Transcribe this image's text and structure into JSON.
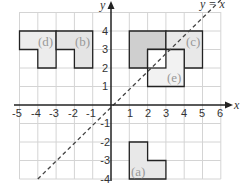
{
  "diagram": {
    "x_axis": {
      "label": "x",
      "ticks": [
        "-5",
        "-4",
        "-3",
        "-2",
        "-1",
        "1",
        "2",
        "3",
        "4",
        "5",
        "6"
      ]
    },
    "y_axis": {
      "label": "y",
      "ticks": [
        "4",
        "3",
        "2",
        "1",
        "-1",
        "-2",
        "-3",
        "-4"
      ]
    },
    "mirror_line_label": "y = x",
    "shapes": [
      {
        "label": "(a)"
      },
      {
        "label": "(b)"
      },
      {
        "label": "(c)"
      },
      {
        "label": "(d)"
      },
      {
        "label": "(e)"
      }
    ],
    "colors": {
      "grid": "#cfcfcf",
      "axis": "#222222",
      "shape_fill_light": "#ececec",
      "shape_fill_dark": "#cfcfcf",
      "outline": "#222222"
    }
  }
}
